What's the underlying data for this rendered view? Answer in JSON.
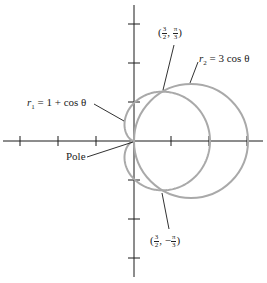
{
  "diagram": {
    "type": "polar-graph",
    "pole_label": "Pole",
    "curves": [
      {
        "name": "r1",
        "label_var": "r",
        "label_sub": "1",
        "label_eq": "= 1 + cos θ",
        "equation": "r = 1 + cos θ",
        "kind": "cardioid",
        "color": "#a9a9a9"
      },
      {
        "name": "r2",
        "label_var": "r",
        "label_sub": "2",
        "label_eq": "= 3 cos θ",
        "equation": "r = 3 cos θ",
        "kind": "circle",
        "color": "#a9a9a9"
      }
    ],
    "intersections": [
      {
        "num": "3",
        "den": "2",
        "angle_sign": "",
        "angle_num": "π",
        "angle_den": "3",
        "label": "(3/2, π/3)"
      },
      {
        "num": "3",
        "den": "2",
        "angle_sign": "−",
        "angle_num": "π",
        "angle_den": "3",
        "label": "(3/2, −π/3)"
      }
    ],
    "axes": {
      "color": "#1a1a1a",
      "horizontal_ticks": [
        -3,
        -2,
        -1,
        1,
        2,
        3
      ],
      "vertical_ticks": [
        -3,
        -2,
        -1,
        1,
        2,
        3
      ]
    }
  }
}
